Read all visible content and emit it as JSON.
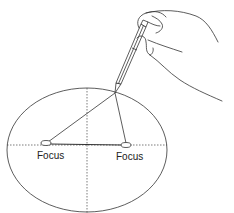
{
  "diagram": {
    "labels": {
      "focus_left": "Focus",
      "focus_right": "Focus"
    },
    "colors": {
      "stroke": "#333333",
      "background": "#ffffff"
    }
  }
}
